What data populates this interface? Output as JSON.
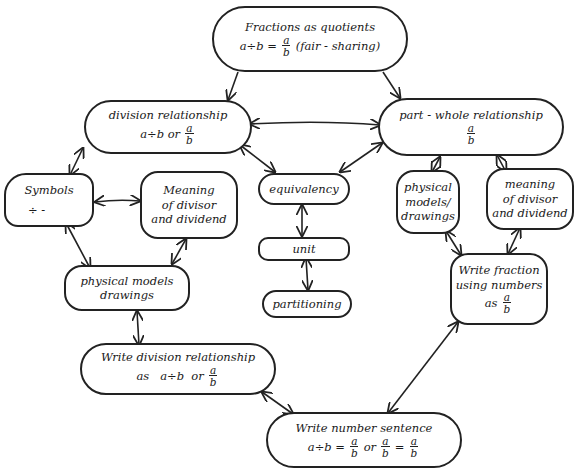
{
  "diagram": {
    "type": "concept-map",
    "style": "hand-drawn",
    "stroke_color": "#222222",
    "background": "#ffffff"
  },
  "nodes": {
    "fractions_quotients": {
      "title": "Fractions as quotients",
      "lhs": "a÷b =",
      "frac_num": "a",
      "frac_den": "b",
      "suffix": "(fair - sharing)"
    },
    "division_relationship": {
      "title": "division relationship",
      "lhs": "a÷b or",
      "frac_num": "a",
      "frac_den": "b"
    },
    "part_whole": {
      "title": "part - whole relationship",
      "frac_num": "a",
      "frac_den": "b"
    },
    "symbols": {
      "title": "Symbols",
      "glyphs": "÷   -"
    },
    "meaning_left": {
      "lines": [
        "Meaning",
        "of divisor",
        "and dividend"
      ]
    },
    "equivalency": {
      "title": "equivalency"
    },
    "unit": {
      "title": "unit"
    },
    "partitioning": {
      "title": "partitioning"
    },
    "physical_right": {
      "lines": [
        "physical",
        "models/",
        "drawings"
      ]
    },
    "meaning_right": {
      "lines": [
        "meaning",
        "of divisor",
        "and dividend"
      ]
    },
    "physical_left": {
      "lines": [
        "physical models",
        "drawings"
      ]
    },
    "write_fraction": {
      "lines": [
        "Write fraction",
        "using numbers"
      ],
      "prefix": "as",
      "frac_num": "a",
      "frac_den": "b"
    },
    "write_division": {
      "title": "Write division relationship",
      "prefix": "as   a÷b  or",
      "frac_num": "a",
      "frac_den": "b"
    },
    "write_number_sentence": {
      "title": "Write number sentence",
      "lhs": "a÷b =",
      "or": "or",
      "eq": "=",
      "frac_num": "a",
      "frac_den": "b"
    }
  },
  "edges": [
    {
      "from": "Fractions as quotients",
      "to": "division relationship",
      "type": "one-way"
    },
    {
      "from": "Fractions as quotients",
      "to": "part - whole relationship",
      "type": "one-way"
    },
    {
      "from": "division relationship",
      "to": "part - whole relationship",
      "type": "two-way"
    },
    {
      "from": "division relationship",
      "to": "Symbols",
      "type": "two-way"
    },
    {
      "from": "division relationship",
      "to": "equivalency",
      "type": "two-way"
    },
    {
      "from": "part - whole relationship",
      "to": "equivalency",
      "type": "two-way"
    },
    {
      "from": "part - whole relationship",
      "to": "physical models/drawings",
      "type": "two-way"
    },
    {
      "from": "part - whole relationship",
      "to": "meaning of divisor and dividend (right)",
      "type": "two-way"
    },
    {
      "from": "Symbols",
      "to": "Meaning of divisor and dividend (left)",
      "type": "two-way"
    },
    {
      "from": "Symbols",
      "to": "physical models drawings",
      "type": "two-way"
    },
    {
      "from": "Meaning of divisor and dividend (left)",
      "to": "physical models drawings",
      "type": "two-way"
    },
    {
      "from": "equivalency",
      "to": "unit",
      "type": "two-way"
    },
    {
      "from": "unit",
      "to": "partitioning",
      "type": "two-way"
    },
    {
      "from": "physical models/drawings",
      "to": "Write fraction using numbers",
      "type": "two-way"
    },
    {
      "from": "meaning of divisor and dividend (right)",
      "to": "Write fraction using numbers",
      "type": "two-way"
    },
    {
      "from": "physical models drawings",
      "to": "Write division relationship",
      "type": "two-way"
    },
    {
      "from": "Write division relationship",
      "to": "Write number sentence",
      "type": "two-way"
    },
    {
      "from": "Write fraction using numbers",
      "to": "Write number sentence",
      "type": "two-way"
    }
  ]
}
